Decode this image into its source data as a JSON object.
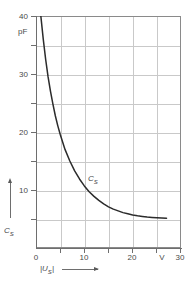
{
  "chart_data": {
    "type": "line",
    "title": "",
    "subtitle": "",
    "xlabel": "|U_S|",
    "ylabel": "C_S",
    "x_unit": "V",
    "y_unit": "pF",
    "xlim": [
      0,
      30
    ],
    "ylim": [
      0,
      40
    ],
    "x_ticks": [
      0,
      5,
      10,
      15,
      20,
      25,
      30
    ],
    "x_tick_labels": [
      "0",
      "",
      "10",
      "",
      "20",
      "",
      "30"
    ],
    "y_ticks": [
      0,
      5,
      10,
      15,
      20,
      25,
      30,
      35,
      40
    ],
    "y_tick_labels": [
      "",
      "",
      "10",
      "",
      "20",
      "",
      "30",
      "",
      "40"
    ],
    "grid": true,
    "grid_spacing_x": 5,
    "grid_spacing_y": 5,
    "legend": "none",
    "series": [
      {
        "name": "C_S",
        "label_on_curve": "C",
        "label_on_curve_sub": "S",
        "x": [
          1.0,
          1.5,
          2.0,
          2.5,
          3.0,
          3.5,
          4.0,
          4.5,
          5.0,
          6.0,
          7.0,
          8.0,
          9.0,
          10.0,
          11.0,
          12.0,
          13.0,
          14.0,
          15.0,
          16.0,
          17.0,
          18.0,
          19.0,
          20.0,
          21.0,
          22.0,
          23.0,
          24.0,
          25.0,
          26.0,
          27.0
        ],
        "y": [
          40.0,
          36.0,
          32.5,
          29.5,
          27.0,
          24.8,
          22.8,
          21.1,
          19.6,
          17.0,
          15.0,
          13.3,
          11.9,
          10.7,
          9.7,
          8.9,
          8.2,
          7.6,
          7.1,
          6.7,
          6.4,
          6.1,
          5.9,
          5.7,
          5.55,
          5.45,
          5.35,
          5.28,
          5.22,
          5.18,
          5.15
        ]
      }
    ],
    "annotations": [
      {
        "name": "x-axis-unit-marker",
        "text": "V",
        "x": 26.5
      },
      {
        "name": "y-axis-unit-marker",
        "text": "pF",
        "y": 37
      }
    ]
  },
  "axes": {
    "y_labels": [
      {
        "value": 40,
        "text": "40"
      },
      {
        "value": 30,
        "text": "30"
      },
      {
        "value": 20,
        "text": "20"
      },
      {
        "value": 10,
        "text": "10"
      }
    ],
    "y_unit_text": "pF",
    "x_labels": [
      {
        "value": 0,
        "text": "0"
      },
      {
        "value": 10,
        "text": "10"
      },
      {
        "value": 20,
        "text": "20"
      },
      {
        "value": 26.5,
        "text": "V"
      },
      {
        "value": 30,
        "text": "30"
      }
    ]
  },
  "labels": {
    "curve_symbol": "C",
    "curve_symbol_sub": "S",
    "y_axis_title": "C",
    "y_axis_title_sub": "S",
    "x_axis_title": "|U",
    "x_axis_title_sub": "S",
    "x_axis_title_end": "|"
  },
  "colors": {
    "curve": "#2b2b2b",
    "grid": "#c9c9c9",
    "axis": "#6e6e6e",
    "frame": "#8a8a8a",
    "text": "#4a4a4a",
    "background": "#ffffff"
  }
}
